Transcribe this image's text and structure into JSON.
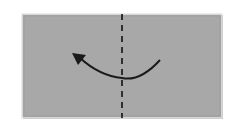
{
  "diagram": {
    "type": "origami-fold-instruction",
    "paper": {
      "x": 22,
      "y": 14,
      "width": 200,
      "height": 104,
      "fill": "#a8a8a8",
      "edge_color": "#e6e6e6",
      "shadow_color": "#8a8a8a"
    },
    "fold_line": {
      "style": "dashed",
      "type": "valley-fold",
      "x": 122,
      "color": "#111111"
    },
    "arrow": {
      "direction": "right-to-left",
      "meaning": "fold right half over to the left",
      "color": "#1a1a1a"
    }
  }
}
